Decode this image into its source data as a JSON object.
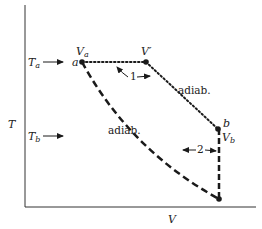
{
  "diagram": {
    "type": "T-V process diagram",
    "axes": {
      "y_label": "T",
      "x_label": "V"
    },
    "levels": {
      "upper": {
        "label": "T",
        "subscript": "a"
      },
      "lower": {
        "label": "T",
        "subscript": "b"
      }
    },
    "points": {
      "a": {
        "label": "a",
        "volume_label": "V",
        "volume_subscript": "a"
      },
      "v_prime": {
        "label": "V′"
      },
      "b": {
        "label": "b",
        "volume_label": "V",
        "volume_subscript": "b"
      }
    },
    "paths": {
      "path1": {
        "number": "1",
        "style": "dotted",
        "segment_label": "adiab."
      },
      "path2": {
        "number": "2",
        "style": "dashed",
        "segment_label": "adiab."
      }
    },
    "colors": {
      "ink": "#1a1a1a",
      "background": "#ffffff"
    }
  }
}
